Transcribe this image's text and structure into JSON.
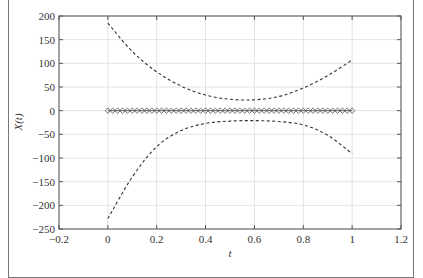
{
  "chart_data": {
    "type": "line",
    "title": "",
    "xlabel": "t",
    "ylabel": "X(t)",
    "xlim": [
      -0.2,
      1.2
    ],
    "ylim": [
      -250,
      200
    ],
    "xticks": [
      -0.2,
      0,
      0.2,
      0.4,
      0.6,
      0.8,
      1,
      1.2
    ],
    "yticks": [
      200,
      150,
      100,
      50,
      0,
      -50,
      -100,
      -150,
      -200,
      -250
    ],
    "xtick_labels": [
      "−0.2",
      "0",
      "0.2",
      "0.4",
      "0.6",
      "0.8",
      "1",
      "1.2"
    ],
    "ytick_labels": [
      "200",
      "150",
      "100",
      "50",
      "0",
      "−50",
      "−100",
      "−150",
      "−200",
      "−250"
    ],
    "grid": true,
    "legend": null,
    "series": [
      {
        "name": "upper bound",
        "style": "dashed",
        "color": "#333333",
        "x": [
          0,
          0.1,
          0.2,
          0.3,
          0.4,
          0.5,
          0.6,
          0.7,
          0.8,
          0.9,
          1.0
        ],
        "y": [
          185,
          125,
          82,
          52,
          33,
          24,
          23,
          30,
          48,
          74,
          107
        ]
      },
      {
        "name": "lower bound",
        "style": "dashed",
        "color": "#333333",
        "x": [
          0,
          0.1,
          0.2,
          0.3,
          0.4,
          0.5,
          0.6,
          0.7,
          0.8,
          0.9,
          1.0
        ],
        "y": [
          -228,
          -140,
          -76,
          -42,
          -27,
          -22,
          -21,
          -23,
          -30,
          -52,
          -91
        ]
      },
      {
        "name": "X(t)",
        "style": "markers",
        "marker": "diamond",
        "color": "#444444",
        "x_range": [
          0,
          1
        ],
        "count": 51,
        "y_value": 0
      }
    ]
  }
}
